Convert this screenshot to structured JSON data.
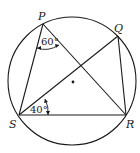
{
  "diagram": {
    "circle": {
      "cx": 72,
      "cy": 81,
      "r": 64,
      "center_marked": true
    },
    "points": {
      "P": {
        "label": "P",
        "x": 43,
        "y": 24
      },
      "Q": {
        "label": "Q",
        "x": 118,
        "y": 36
      },
      "R": {
        "label": "R",
        "x": 126,
        "y": 115
      },
      "S": {
        "label": "S",
        "x": 19,
        "y": 115
      }
    },
    "segments": [
      "PS",
      "PR",
      "SQ",
      "QR",
      "SR"
    ],
    "angles": [
      {
        "vertex": "P",
        "between": [
          "PS",
          "PR"
        ],
        "label": "60°"
      },
      {
        "vertex": "S",
        "between": [
          "SQ",
          "SR"
        ],
        "label": "40°"
      }
    ]
  }
}
